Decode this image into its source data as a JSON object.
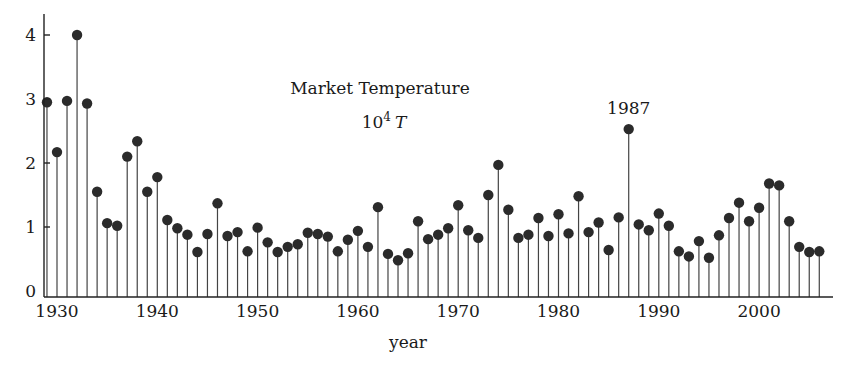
{
  "chart_data": {
    "type": "stem",
    "title": "Market Temperature",
    "subtitle": "10^4 T",
    "subtitle_base": "10",
    "subtitle_exp": "4",
    "subtitle_var": "T",
    "xlabel": "year",
    "ylabel": "",
    "xlim": [
      1928,
      2007
    ],
    "ylim": [
      0,
      4.3
    ],
    "xticks": [
      1930,
      1940,
      1950,
      1960,
      1970,
      1980,
      1990,
      2000
    ],
    "yticks": [
      0,
      1,
      2,
      3,
      4
    ],
    "grid": false,
    "legend": null,
    "annotations": [
      {
        "text": "1987",
        "x": 1987
      }
    ],
    "x": [
      1929,
      1930,
      1931,
      1932,
      1933,
      1934,
      1935,
      1936,
      1937,
      1938,
      1939,
      1940,
      1941,
      1942,
      1943,
      1944,
      1945,
      1946,
      1947,
      1948,
      1949,
      1950,
      1951,
      1952,
      1953,
      1954,
      1955,
      1956,
      1957,
      1958,
      1959,
      1960,
      1961,
      1962,
      1963,
      1964,
      1965,
      1966,
      1967,
      1968,
      1969,
      1970,
      1971,
      1972,
      1973,
      1974,
      1975,
      1976,
      1977,
      1978,
      1979,
      1980,
      1981,
      1982,
      1983,
      1984,
      1985,
      1986,
      1987,
      1988,
      1989,
      1990,
      1991,
      1992,
      1993,
      1994,
      1995,
      1996,
      1997,
      1998,
      1999,
      2000,
      2001,
      2002,
      2003,
      2004,
      2005,
      2006
    ],
    "values": [
      2.95,
      2.17,
      2.97,
      4.0,
      2.93,
      1.55,
      1.06,
      1.02,
      2.1,
      2.34,
      1.55,
      1.78,
      1.11,
      0.98,
      0.88,
      0.61,
      0.89,
      1.37,
      0.86,
      0.92,
      0.62,
      0.99,
      0.76,
      0.61,
      0.69,
      0.73,
      0.91,
      0.89,
      0.85,
      0.62,
      0.8,
      0.94,
      0.69,
      1.31,
      0.58,
      0.48,
      0.59,
      1.09,
      0.81,
      0.88,
      0.98,
      1.34,
      0.95,
      0.83,
      1.5,
      1.97,
      1.27,
      0.83,
      0.88,
      1.14,
      0.86,
      1.2,
      0.9,
      1.48,
      0.92,
      1.07,
      0.64,
      1.15,
      2.53,
      1.04,
      0.95,
      1.21,
      1.02,
      0.62,
      0.54,
      0.78,
      0.52,
      0.87,
      1.14,
      1.38,
      1.09,
      1.3,
      1.68,
      1.65,
      1.09,
      0.69,
      0.61,
      0.62
    ]
  }
}
